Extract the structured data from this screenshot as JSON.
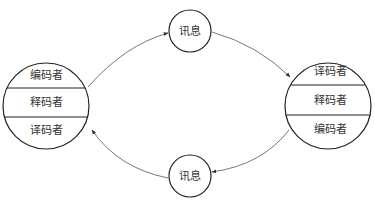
{
  "colors": {
    "stroke": "#222222",
    "arrow": "#444444",
    "text": "#333333",
    "background": "#ffffff"
  },
  "nodes": {
    "left": {
      "sections": [
        "编码者",
        "释码者",
        "译码者"
      ]
    },
    "right": {
      "sections": [
        "译码者",
        "释码者",
        "编码者"
      ]
    },
    "top_message": {
      "label": "讯息"
    },
    "bottom_message": {
      "label": "讯息"
    }
  },
  "edges": [
    {
      "from": "left",
      "to": "top_message"
    },
    {
      "from": "top_message",
      "to": "right"
    },
    {
      "from": "right",
      "to": "bottom_message"
    },
    {
      "from": "bottom_message",
      "to": "left"
    }
  ]
}
